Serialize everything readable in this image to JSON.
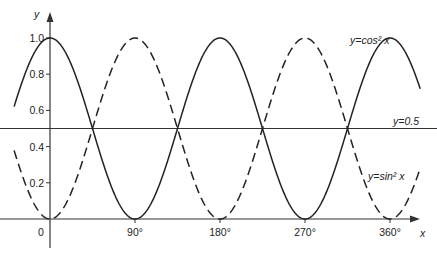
{
  "chart_data": {
    "type": "line",
    "title": "",
    "xlabel": "x",
    "ylabel": "y",
    "xlim": [
      -38,
      392
    ],
    "ylim": [
      0,
      1.0
    ],
    "x_ticks": [
      {
        "value": 0,
        "label": "0"
      },
      {
        "value": 90,
        "label": "90°"
      },
      {
        "value": 180,
        "label": "180°"
      },
      {
        "value": 270,
        "label": "270°"
      },
      {
        "value": 360,
        "label": "360°"
      }
    ],
    "y_ticks": [
      {
        "value": 0.2,
        "label": "0.2"
      },
      {
        "value": 0.4,
        "label": "0.4"
      },
      {
        "value": 0.6,
        "label": "0.6"
      },
      {
        "value": 0.8,
        "label": "0.8"
      },
      {
        "value": 1.0,
        "label": "1.0"
      }
    ],
    "grid": false,
    "series": [
      {
        "name": "y=cos² x",
        "function": "cos^2(x)",
        "style": "solid",
        "label_pos": [
          350,
          20
        ]
      },
      {
        "name": "y=sin² x",
        "function": "sin^2(x)",
        "style": "dashed",
        "label_pos": [
          348,
          178
        ]
      },
      {
        "name": "y=0.5",
        "function": "0.5",
        "style": "solid",
        "label_pos": [
          370,
          124
        ]
      }
    ],
    "intersections_x_deg": [
      45,
      135,
      225,
      315
    ]
  }
}
